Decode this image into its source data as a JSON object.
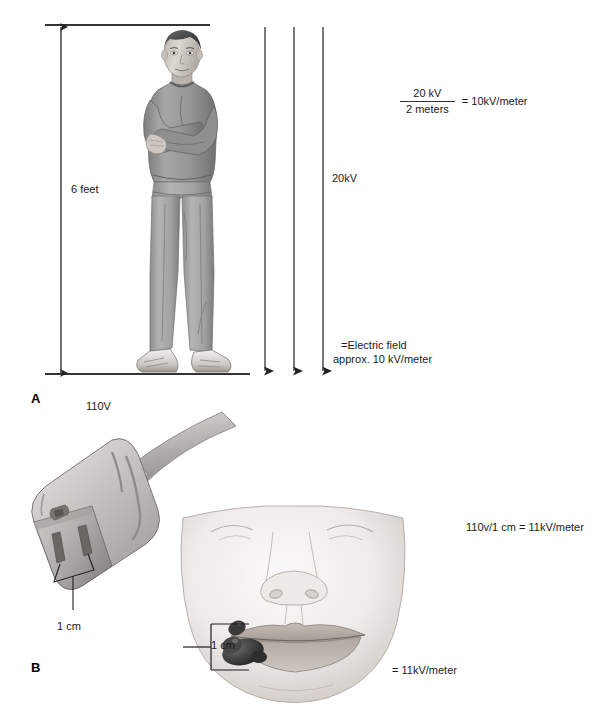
{
  "figure": {
    "panels": [
      {
        "letter": "A",
        "subject": "adult-standing-in-electric-field",
        "height_label": "6 feet",
        "field_label": "20kV",
        "field_note_line1": "=Electric field",
        "field_note_line2": "approx. 10 kV/meter",
        "equation": {
          "numerator": "20 kV",
          "denominator": "2 meters",
          "result": "= 10kV/meter"
        },
        "arrow_count": 3
      },
      {
        "letter": "B",
        "subject": "electrical-cord-receptacle-and-infant-oral-commissure-burn",
        "voltage_label": "110V",
        "plug_gap_label": "1 cm",
        "mouth_gap_label": "1 cm",
        "equation_inline": "110v/1 cm = 11kV/meter",
        "result_label": "= 11kV/meter"
      }
    ]
  },
  "colors": {
    "ink": "#1a1a1a",
    "line": "#333333",
    "background": "#ffffff",
    "skin_light": "#e8e4e0",
    "skin_mid": "#cfc8c2",
    "skin_shadow": "#a89f98",
    "garment_dark": "#8c8c8c",
    "garment_mid": "#a3a3a3",
    "garment_light": "#bcbcbc",
    "hair": "#4d4d4d",
    "plug_light": "#d2d2d2",
    "plug_mid": "#b0b0b0",
    "plug_dark": "#8a8a8a",
    "slot": "#6f6f6f",
    "eschar": "#3b3b3b",
    "lip": "#b5aca6"
  }
}
